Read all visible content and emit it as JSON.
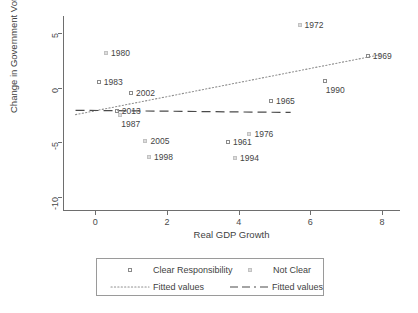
{
  "chart_data": {
    "type": "scatter",
    "title": "",
    "xlabel": "Real GDP Growth",
    "ylabel": "Change in Government Vote",
    "xlim": [
      -0.9,
      8.5
    ],
    "ylim": [
      -11.2,
      6.6
    ],
    "xticks": [
      "0",
      "2",
      "4",
      "6",
      "8"
    ],
    "xtick_values": [
      0,
      2,
      4,
      6,
      8
    ],
    "yticks": [
      "-10",
      "-5",
      "0",
      "5"
    ],
    "ytick_values": [
      -10,
      -5,
      0,
      5
    ],
    "grid": false,
    "legend_position": "below-plot",
    "series": [
      {
        "name": "Clear Responsibility",
        "marker": "open-square",
        "points": [
          {
            "label": "1983",
            "x": 0.1,
            "y": 0.5,
            "label_side": "right"
          },
          {
            "label": "2013",
            "x": 0.6,
            "y": -2.1,
            "label_side": "right"
          },
          {
            "label": "2002",
            "x": 1.0,
            "y": -0.5,
            "label_side": "right"
          },
          {
            "label": "1961",
            "x": 3.7,
            "y": -5.0,
            "label_side": "right"
          },
          {
            "label": "1965",
            "x": 4.9,
            "y": -1.2,
            "label_side": "right"
          },
          {
            "label": "1990",
            "x": 6.4,
            "y": 0.6,
            "label_side": "below"
          },
          {
            "label": "1969",
            "x": 7.6,
            "y": 2.9,
            "label_side": "right"
          }
        ]
      },
      {
        "name": "Not Clear",
        "marker": "small-square",
        "points": [
          {
            "label": "1980",
            "x": 0.3,
            "y": 3.2,
            "label_side": "right"
          },
          {
            "label": "1987",
            "x": 0.7,
            "y": -2.5,
            "label_side": "below"
          },
          {
            "label": "2005",
            "x": 1.4,
            "y": -4.9,
            "label_side": "right"
          },
          {
            "label": "1998",
            "x": 1.5,
            "y": -6.3,
            "label_side": "right"
          },
          {
            "label": "1994",
            "x": 3.9,
            "y": -6.4,
            "label_side": "right"
          },
          {
            "label": "1976",
            "x": 4.3,
            "y": -4.2,
            "label_side": "right"
          },
          {
            "label": "1972",
            "x": 5.7,
            "y": 5.8,
            "label_side": "right"
          }
        ]
      }
    ],
    "fits": [
      {
        "name": "Fitted values",
        "style": "dotted",
        "for_series": "Clear Responsibility",
        "x0": -0.55,
        "y0": -2.45,
        "x1": 7.95,
        "y1": 3.05
      },
      {
        "name": "Fitted values",
        "style": "dashed",
        "for_series": "Not Clear",
        "x0": -0.55,
        "y0": -2.05,
        "x1": 5.45,
        "y1": -2.25
      }
    ]
  },
  "legend": {
    "entries": [
      {
        "key": "open-square",
        "label": "Clear Responsibility"
      },
      {
        "key": "small-square",
        "label": "Not Clear"
      },
      {
        "key": "dotted-line",
        "label": "Fitted values"
      },
      {
        "key": "dashed-line",
        "label": "Fitted values"
      }
    ]
  }
}
